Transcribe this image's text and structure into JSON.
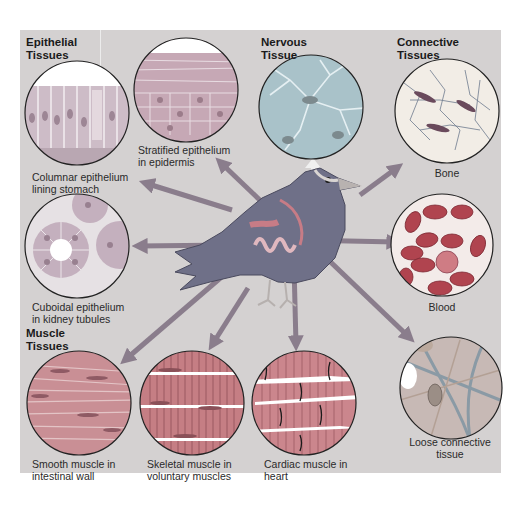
{
  "figure": {
    "headings": {
      "epithelial": "Epithelial\nTissues",
      "nervous": "Nervous\nTissue",
      "connective": "Connective\nTissues",
      "muscle": "Muscle\nTissues"
    },
    "tissues": [
      {
        "id": "columnar",
        "group": "epithelial",
        "label": "Columnar epithelium\nlining stomach"
      },
      {
        "id": "stratified",
        "group": "epithelial",
        "label": "Stratified epithelium\nin epidermis"
      },
      {
        "id": "cuboidal",
        "group": "epithelial",
        "label": "Cuboidal epithelium\nin kidney tubules"
      },
      {
        "id": "nervous",
        "group": "nervous",
        "label": ""
      },
      {
        "id": "bone",
        "group": "connective",
        "label": "Bone"
      },
      {
        "id": "blood",
        "group": "connective",
        "label": "Blood"
      },
      {
        "id": "loose",
        "group": "connective",
        "label": "Loose connective\ntissue"
      },
      {
        "id": "smooth",
        "group": "muscle",
        "label": "Smooth muscle in\nintestinal wall"
      },
      {
        "id": "skeletal",
        "group": "muscle",
        "label": "Skeletal muscle in\nvoluntary muscles"
      },
      {
        "id": "cardiac",
        "group": "muscle",
        "label": "Cardiac muscle in\nheart"
      }
    ],
    "colors": {
      "panel": "#d4d1d1",
      "arrow": "#8a7d8c",
      "bird_body": "#6f7088",
      "bird_organs": "#c77c86",
      "circle_border": "#222222",
      "epithelium": "#c9b9c3",
      "blood_cells": "#b0444f",
      "bone": "#efe8e0",
      "muscle": "#c98a8a"
    }
  }
}
